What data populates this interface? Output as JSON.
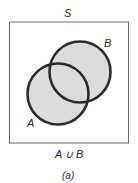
{
  "diagram": {
    "universe_label": "S",
    "set_a_label": "A",
    "set_b_label": "B",
    "operation_label": "A ∪ B",
    "caption": "(a)",
    "shaded_region": "union of A and B",
    "colors": {
      "frame": "#6a6a6a",
      "circle_stroke": "#2b2b2b",
      "fill": "#dcdcdc",
      "background": "#ffffff"
    }
  }
}
